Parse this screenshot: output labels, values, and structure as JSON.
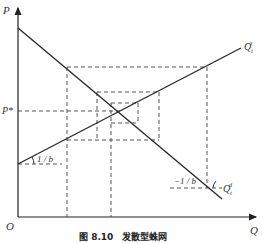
{
  "figure": {
    "caption": "图 8.10　发散型蛛网",
    "axes": {
      "y_label": "P",
      "x_label": "Q",
      "origin_label": "O",
      "equilibrium_price_label": "P*"
    },
    "curves": {
      "supply_label": "Q",
      "supply_sup": "s",
      "supply_sub": "t",
      "demand_label": "Q",
      "demand_sup": "d",
      "demand_sub": "t"
    },
    "slopes": {
      "supply_slope_label": "1 / b",
      "demand_slope_label": "−1 / b"
    },
    "colors": {
      "line": "#2a2a2a",
      "dashed": "#555555",
      "text": "#333333"
    }
  }
}
